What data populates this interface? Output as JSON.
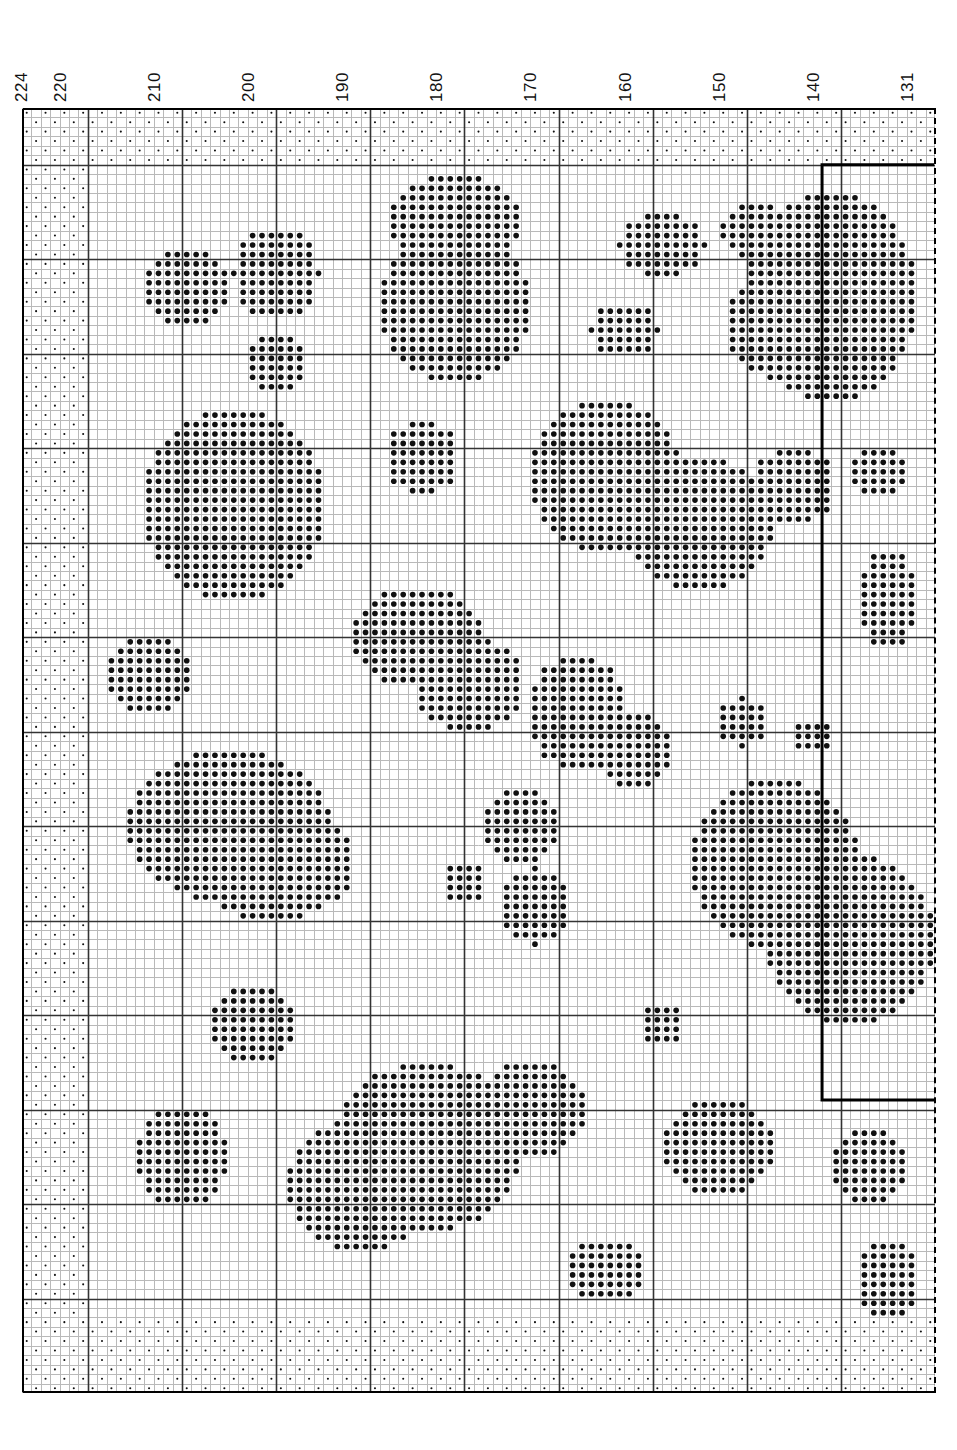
{
  "document": {
    "kind": "cross-stitch-chart",
    "title": "",
    "page_width": 957,
    "page_height": 1450
  },
  "ruler": {
    "name": "column-number-ruler",
    "orientation": "horizontal-top",
    "label_rotation_deg": -90,
    "labels": [
      {
        "text": "224",
        "x": 30
      },
      {
        "text": "220",
        "x": 69
      },
      {
        "text": "210",
        "x": 163
      },
      {
        "text": "200",
        "x": 257
      },
      {
        "text": "190",
        "x": 351
      },
      {
        "text": "180",
        "x": 445
      },
      {
        "text": "170",
        "x": 539
      },
      {
        "text": "160",
        "x": 634
      },
      {
        "text": "150",
        "x": 728
      },
      {
        "text": "140",
        "x": 822
      },
      {
        "text": "131",
        "x": 916
      }
    ]
  },
  "grid": {
    "name": "stitch-grid",
    "left": 22,
    "top": 108,
    "width": 913,
    "height": 1285,
    "cols": 97,
    "rows": 136,
    "cell": 9.41,
    "minor_line_color": "#b9b9b9",
    "major_line_color": "#333333",
    "major_every": 10,
    "major_offset_col": 7,
    "major_offset_row": 6,
    "border_color": "#000000",
    "right_edge_style": "dashed"
  },
  "symbols": {
    "full_stitch": {
      "name": "filled-dot",
      "glyph": "●",
      "color": "#101010",
      "radius_ratio": 0.3
    },
    "half_stitch": {
      "name": "small-dot",
      "glyph": "·",
      "color": "#101010",
      "radius_ratio": 0.11
    }
  },
  "legend": {
    "note": "Single colour chart: large dots = stitched cells, small dots = unstitched fabric reference grid"
  },
  "design_boundary": {
    "name": "design-overlap-box",
    "stroke": "#000000",
    "stroke_width": 3,
    "left_col": 85,
    "top_row": 6,
    "right_col": 97,
    "bottom_row": 105
  },
  "chart_data": {
    "type": "heatmap",
    "title": "",
    "xlabel": "",
    "ylabel": "",
    "cols": 97,
    "rows": 136,
    "sparse_border": {
      "top_rows": 6,
      "bottom_rows": 8,
      "left_cols": 7,
      "right_cols": 0,
      "pattern": "checkerboard"
    },
    "blobs": [
      {
        "id": "b01",
        "cx": 46.0,
        "cy": 12.0,
        "rx": 7.5,
        "ry": 5.0
      },
      {
        "id": "b02",
        "cx": 46.0,
        "cy": 21.0,
        "rx": 8.0,
        "ry": 8.0
      },
      {
        "id": "b03",
        "cx": 27.0,
        "cy": 17.5,
        "rx": 4.5,
        "ry": 5.0
      },
      {
        "id": "b04",
        "cx": 17.5,
        "cy": 19.0,
        "rx": 4.5,
        "ry": 4.0
      },
      {
        "id": "b05",
        "cx": 27.0,
        "cy": 27.0,
        "rx": 3.5,
        "ry": 3.5
      },
      {
        "id": "b06",
        "cx": 68.0,
        "cy": 14.5,
        "rx": 4.5,
        "ry": 3.5
      },
      {
        "id": "b07",
        "cx": 78.0,
        "cy": 13.0,
        "rx": 4.0,
        "ry": 3.0
      },
      {
        "id": "b08",
        "cx": 86.0,
        "cy": 20.0,
        "rx": 9.0,
        "ry": 11.0
      },
      {
        "id": "b09",
        "cx": 79.5,
        "cy": 23.0,
        "rx": 5.0,
        "ry": 5.5
      },
      {
        "id": "b10",
        "cx": 64.0,
        "cy": 23.5,
        "rx": 3.5,
        "ry": 3.0
      },
      {
        "id": "b11",
        "cx": 22.5,
        "cy": 42.0,
        "rx": 10.0,
        "ry": 10.0
      },
      {
        "id": "b12",
        "cx": 42.5,
        "cy": 37.0,
        "rx": 4.0,
        "ry": 4.0
      },
      {
        "id": "b13",
        "cx": 62.0,
        "cy": 39.0,
        "rx": 8.0,
        "ry": 8.0
      },
      {
        "id": "b14",
        "cx": 72.0,
        "cy": 44.0,
        "rx": 8.0,
        "ry": 7.0
      },
      {
        "id": "b15",
        "cx": 82.0,
        "cy": 40.0,
        "rx": 4.5,
        "ry": 4.0
      },
      {
        "id": "b16",
        "cx": 91.0,
        "cy": 38.5,
        "rx": 3.0,
        "ry": 3.0
      },
      {
        "id": "b17",
        "cx": 92.0,
        "cy": 52.0,
        "rx": 3.5,
        "ry": 5.0
      },
      {
        "id": "b18",
        "cx": 42.0,
        "cy": 56.0,
        "rx": 7.0,
        "ry": 5.5
      },
      {
        "id": "b19",
        "cx": 47.5,
        "cy": 61.0,
        "rx": 6.0,
        "ry": 5.0
      },
      {
        "id": "b20",
        "cx": 13.5,
        "cy": 60.0,
        "rx": 4.5,
        "ry": 4.0
      },
      {
        "id": "b21",
        "cx": 59.0,
        "cy": 64.0,
        "rx": 5.5,
        "ry": 6.0
      },
      {
        "id": "b22",
        "cx": 65.0,
        "cy": 68.0,
        "rx": 4.0,
        "ry": 4.0
      },
      {
        "id": "b23",
        "cx": 76.5,
        "cy": 65.0,
        "rx": 2.5,
        "ry": 2.5
      },
      {
        "id": "b24",
        "cx": 84.0,
        "cy": 66.5,
        "rx": 2.0,
        "ry": 2.0
      },
      {
        "id": "b25",
        "cx": 22.0,
        "cy": 76.0,
        "rx": 11.0,
        "ry": 8.0
      },
      {
        "id": "b26",
        "cx": 26.5,
        "cy": 80.0,
        "rx": 9.0,
        "ry": 6.0
      },
      {
        "id": "b27",
        "cx": 53.0,
        "cy": 76.0,
        "rx": 4.0,
        "ry": 4.0
      },
      {
        "id": "b28",
        "cx": 47.0,
        "cy": 82.0,
        "rx": 2.5,
        "ry": 2.5
      },
      {
        "id": "b29",
        "cx": 54.5,
        "cy": 84.5,
        "rx": 3.5,
        "ry": 4.0
      },
      {
        "id": "b30",
        "cx": 80.0,
        "cy": 80.0,
        "rx": 9.0,
        "ry": 9.0
      },
      {
        "id": "b31",
        "cx": 88.0,
        "cy": 88.0,
        "rx": 9.0,
        "ry": 9.0
      },
      {
        "id": "b32",
        "cx": 24.5,
        "cy": 97.0,
        "rx": 5.0,
        "ry": 4.0
      },
      {
        "id": "b33",
        "cx": 68.0,
        "cy": 97.0,
        "rx": 2.5,
        "ry": 2.5
      },
      {
        "id": "b34",
        "cx": 43.0,
        "cy": 110.0,
        "rx": 10.0,
        "ry": 9.0
      },
      {
        "id": "b35",
        "cx": 36.0,
        "cy": 114.0,
        "rx": 8.0,
        "ry": 7.0
      },
      {
        "id": "b36",
        "cx": 54.0,
        "cy": 106.0,
        "rx": 6.0,
        "ry": 5.0
      },
      {
        "id": "b37",
        "cx": 17.0,
        "cy": 111.0,
        "rx": 5.0,
        "ry": 5.5
      },
      {
        "id": "b38",
        "cx": 74.0,
        "cy": 110.0,
        "rx": 6.0,
        "ry": 5.0
      },
      {
        "id": "b39",
        "cx": 90.0,
        "cy": 112.0,
        "rx": 4.0,
        "ry": 4.0
      },
      {
        "id": "b40",
        "cx": 62.0,
        "cy": 123.0,
        "rx": 4.5,
        "ry": 3.5
      },
      {
        "id": "b41",
        "cx": 92.0,
        "cy": 124.0,
        "rx": 3.5,
        "ry": 4.0
      }
    ]
  }
}
